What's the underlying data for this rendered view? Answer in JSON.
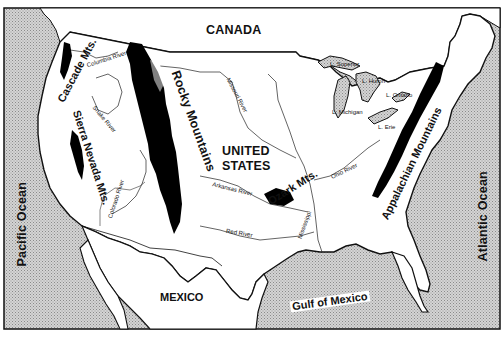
{
  "map": {
    "title": "United States physical map: mountains and rivers",
    "colors": {
      "water_fill": "#c9c9c9",
      "land_fill": "#ffffff",
      "outline": "#111111",
      "mountains": "#000000"
    },
    "countries": [
      {
        "id": "canada",
        "label": "CANADA"
      },
      {
        "id": "usa",
        "label": "UNITED\nSTATES",
        "line1": "UNITED",
        "line2": "STATES"
      },
      {
        "id": "mexico",
        "label": "MEXICO"
      }
    ],
    "water_bodies": [
      {
        "id": "pacific",
        "label": "Pacific Ocean"
      },
      {
        "id": "atlantic",
        "label": "Atlantic Ocean"
      },
      {
        "id": "gulf",
        "label": "Gulf of Mexico"
      },
      {
        "id": "superior",
        "label": "L. Superior"
      },
      {
        "id": "huron",
        "label": "L. Huron"
      },
      {
        "id": "michigan",
        "label": "L. Michigan"
      },
      {
        "id": "ontario",
        "label": "L. Ontario"
      },
      {
        "id": "erie",
        "label": "L. Erie"
      }
    ],
    "mountains": [
      {
        "id": "cascade",
        "label": "Cascade Mts."
      },
      {
        "id": "sierra",
        "label": "Sierra Nevada Mts."
      },
      {
        "id": "rocky",
        "label": "Rocky Mountains"
      },
      {
        "id": "ozark",
        "label": "Ozark Mts."
      },
      {
        "id": "appalachian",
        "label": "Appalachian Mountains"
      }
    ],
    "rivers": [
      {
        "id": "columbia",
        "label": "Columbia River"
      },
      {
        "id": "snake",
        "label": "Snake River"
      },
      {
        "id": "missouri",
        "label": "Missouri River"
      },
      {
        "id": "colorado",
        "label": "Colorado River"
      },
      {
        "id": "arkansas",
        "label": "Arkansas River"
      },
      {
        "id": "red",
        "label": "Red River"
      },
      {
        "id": "ohio",
        "label": "Ohio River"
      },
      {
        "id": "mississippi",
        "label": "Mississippi"
      }
    ]
  }
}
